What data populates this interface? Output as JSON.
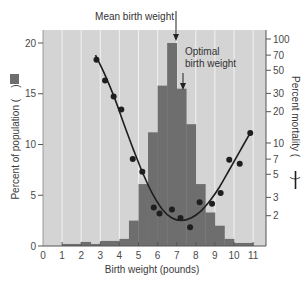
{
  "chart_data": {
    "type": "bar+line",
    "title": "",
    "xlabel": "Birth weight (pounds)",
    "ylabel_left": "Percent of population (bar)",
    "ylabel_right": "Percent mortality (line)",
    "ylabel_left_text": "Percent of population (",
    "ylabel_right_text": "Percent mortality (",
    "label_close": ")",
    "x_ticks": [
      0,
      1,
      2,
      3,
      4,
      5,
      6,
      7,
      8,
      9,
      10,
      11
    ],
    "xlim": [
      0,
      11.5
    ],
    "y_left_ticks": [
      0,
      5,
      10,
      15,
      20
    ],
    "y_left_lim": [
      0,
      21
    ],
    "y_right_ticks": [
      2,
      3,
      5,
      7,
      10,
      20,
      30,
      50,
      70,
      100
    ],
    "y_right_scale": "log",
    "y_right_lim": [
      1,
      120
    ],
    "grid": "vertical lines every 1 lb",
    "histogram": {
      "name": "Percent of population",
      "bins": [
        {
          "x0": 1.0,
          "x1": 2.0,
          "value": 0.2
        },
        {
          "x0": 2.0,
          "x1": 2.5,
          "value": 0.4
        },
        {
          "x0": 2.5,
          "x1": 3.0,
          "value": 0.2
        },
        {
          "x0": 3.0,
          "x1": 4.0,
          "value": 0.5
        },
        {
          "x0": 4.0,
          "x1": 4.5,
          "value": 0.7
        },
        {
          "x0": 4.5,
          "x1": 5.0,
          "value": 2.5
        },
        {
          "x0": 5.0,
          "x1": 5.5,
          "value": 6.1
        },
        {
          "x0": 5.5,
          "x1": 6.0,
          "value": 11.2
        },
        {
          "x0": 6.0,
          "x1": 6.5,
          "value": 15.8
        },
        {
          "x0": 6.5,
          "x1": 7.0,
          "value": 20.0
        },
        {
          "x0": 7.0,
          "x1": 7.5,
          "value": 15.5
        },
        {
          "x0": 7.5,
          "x1": 8.0,
          "value": 12.0
        },
        {
          "x0": 8.0,
          "x1": 8.5,
          "value": 6.1
        },
        {
          "x0": 8.5,
          "x1": 9.0,
          "value": 3.3
        },
        {
          "x0": 9.0,
          "x1": 9.5,
          "value": 2.0
        },
        {
          "x0": 9.5,
          "x1": 10.0,
          "value": 0.7
        },
        {
          "x0": 10.0,
          "x1": 11.0,
          "value": 0.3
        }
      ]
    },
    "mortality_points": {
      "name": "Percent mortality (observed)",
      "x": [
        2.8,
        3.25,
        3.7,
        4.1,
        4.7,
        5.2,
        5.8,
        6.1,
        6.75,
        7.2,
        7.7,
        8.2,
        8.85,
        9.3,
        9.75,
        10.3,
        10.85
      ],
      "y": [
        63,
        40,
        28,
        21,
        7.0,
        5.3,
        2.4,
        2.1,
        2.3,
        1.9,
        1.55,
        2.7,
        2.6,
        3.3,
        6.9,
        6.3,
        12.5
      ]
    },
    "mortality_curve": {
      "name": "Percent mortality (fitted)",
      "x": [
        2.75,
        3.25,
        3.75,
        4.25,
        4.75,
        5.25,
        5.75,
        6.25,
        6.75,
        7.25,
        7.75,
        8.25,
        8.75,
        9.25,
        9.75,
        10.25,
        10.85
      ],
      "y": [
        70,
        45,
        27,
        15,
        8.5,
        5.0,
        3.2,
        2.3,
        1.9,
        1.8,
        1.9,
        2.2,
        2.8,
        3.8,
        5.5,
        8.0,
        12.5
      ]
    },
    "annotations": [
      {
        "text": "Mean birth weight",
        "x": 7.0,
        "arrow_to_value": 20
      },
      {
        "text_line1": "Optimal",
        "text_line2": "birth weight",
        "x": 7.3,
        "arrow_to_value": 15.5
      }
    ]
  },
  "colors": {
    "plot_bg": "#d4d4d4",
    "grid": "#f2f2f2",
    "bar": "#6e6e6e",
    "line": "#1e1e1e",
    "point": "#1e1e1e",
    "axis": "#555555"
  }
}
